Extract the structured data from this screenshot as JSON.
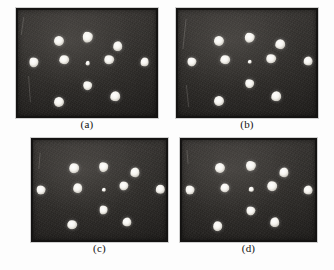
{
  "figure": {
    "kind": "photo-panel-grid",
    "background_color": "#fdfdfd",
    "plate_color": "#2b2926",
    "dot_color": "#ffffff",
    "canvas": {
      "width": 334,
      "height": 270
    },
    "panels": [
      {
        "id": "a",
        "caption": "(a)",
        "rect": {
          "x": 16,
          "y": 8,
          "w": 142,
          "h": 110
        },
        "caption_y": 118,
        "dots": [
          {
            "x": 0.505,
            "y": 0.265,
            "r": 5.2
          },
          {
            "x": 0.3,
            "y": 0.3,
            "r": 5.0
          },
          {
            "x": 0.715,
            "y": 0.345,
            "r": 4.8
          },
          {
            "x": 0.125,
            "y": 0.495,
            "r": 4.6
          },
          {
            "x": 0.34,
            "y": 0.47,
            "r": 4.8
          },
          {
            "x": 0.505,
            "y": 0.5,
            "r": 2.3
          },
          {
            "x": 0.655,
            "y": 0.47,
            "r": 4.8
          },
          {
            "x": 0.905,
            "y": 0.495,
            "r": 4.4
          },
          {
            "x": 0.505,
            "y": 0.705,
            "r": 4.8
          },
          {
            "x": 0.3,
            "y": 0.85,
            "r": 5.0
          },
          {
            "x": 0.7,
            "y": 0.8,
            "r": 4.8
          }
        ],
        "scratches": [
          {
            "x": 0.045,
            "y": 0.08,
            "w": 1,
            "h": 18,
            "rot": 8
          },
          {
            "x": 0.09,
            "y": 0.62,
            "w": 1,
            "h": 26,
            "rot": -4
          }
        ]
      },
      {
        "id": "b",
        "caption": "(b)",
        "rect": {
          "x": 176,
          "y": 8,
          "w": 142,
          "h": 110
        },
        "caption_y": 118,
        "dots": [
          {
            "x": 0.52,
            "y": 0.27,
            "r": 5.2
          },
          {
            "x": 0.3,
            "y": 0.3,
            "r": 5.0
          },
          {
            "x": 0.735,
            "y": 0.33,
            "r": 4.8
          },
          {
            "x": 0.11,
            "y": 0.49,
            "r": 4.6
          },
          {
            "x": 0.345,
            "y": 0.47,
            "r": 4.8
          },
          {
            "x": 0.52,
            "y": 0.49,
            "r": 2.3
          },
          {
            "x": 0.67,
            "y": 0.46,
            "r": 4.8
          },
          {
            "x": 0.93,
            "y": 0.485,
            "r": 4.4
          },
          {
            "x": 0.52,
            "y": 0.69,
            "r": 4.8
          },
          {
            "x": 0.3,
            "y": 0.845,
            "r": 5.0
          },
          {
            "x": 0.705,
            "y": 0.8,
            "r": 4.8
          }
        ],
        "scratches": [
          {
            "x": 0.055,
            "y": 0.1,
            "w": 1,
            "h": 30,
            "rot": 6
          },
          {
            "x": 0.075,
            "y": 0.7,
            "w": 1,
            "h": 22,
            "rot": -6
          }
        ]
      },
      {
        "id": "c",
        "caption": "(c)",
        "rect": {
          "x": 31,
          "y": 138,
          "w": 137,
          "h": 104
        },
        "caption_y": 242,
        "dots": [
          {
            "x": 0.53,
            "y": 0.28,
            "r": 4.8
          },
          {
            "x": 0.315,
            "y": 0.29,
            "r": 4.8
          },
          {
            "x": 0.76,
            "y": 0.33,
            "r": 4.6
          },
          {
            "x": 0.075,
            "y": 0.5,
            "r": 4.4
          },
          {
            "x": 0.34,
            "y": 0.48,
            "r": 4.8
          },
          {
            "x": 0.53,
            "y": 0.5,
            "r": 2.2
          },
          {
            "x": 0.68,
            "y": 0.46,
            "r": 4.6
          },
          {
            "x": 0.945,
            "y": 0.495,
            "r": 4.2
          },
          {
            "x": 0.53,
            "y": 0.695,
            "r": 4.4
          },
          {
            "x": 0.3,
            "y": 0.835,
            "r": 4.8
          },
          {
            "x": 0.7,
            "y": 0.805,
            "r": 4.6
          }
        ],
        "scratches": [
          {
            "x": 0.06,
            "y": 0.14,
            "w": 1,
            "h": 16,
            "rot": 5
          }
        ]
      },
      {
        "id": "d",
        "caption": "(d)",
        "rect": {
          "x": 180,
          "y": 138,
          "w": 137,
          "h": 104
        },
        "caption_y": 242,
        "dots": [
          {
            "x": 0.52,
            "y": 0.265,
            "r": 5.0
          },
          {
            "x": 0.29,
            "y": 0.29,
            "r": 5.0
          },
          {
            "x": 0.76,
            "y": 0.33,
            "r": 4.6
          },
          {
            "x": 0.075,
            "y": 0.5,
            "r": 4.4
          },
          {
            "x": 0.33,
            "y": 0.48,
            "r": 4.6
          },
          {
            "x": 0.52,
            "y": 0.495,
            "r": 2.2
          },
          {
            "x": 0.675,
            "y": 0.465,
            "r": 4.8
          },
          {
            "x": 0.935,
            "y": 0.5,
            "r": 4.4
          },
          {
            "x": 0.52,
            "y": 0.7,
            "r": 4.6
          },
          {
            "x": 0.275,
            "y": 0.85,
            "r": 4.8
          },
          {
            "x": 0.69,
            "y": 0.81,
            "r": 4.8
          }
        ],
        "scratches": [
          {
            "x": 0.05,
            "y": 0.12,
            "w": 1,
            "h": 14,
            "rot": -5
          }
        ]
      }
    ]
  }
}
